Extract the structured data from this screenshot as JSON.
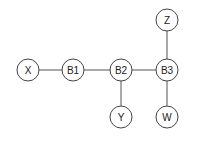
{
  "diagram": {
    "nodes": [
      {
        "id": "X",
        "label": "X",
        "cx": 28,
        "cy": 70
      },
      {
        "id": "B1",
        "label": "B1",
        "cx": 73,
        "cy": 70
      },
      {
        "id": "B2",
        "label": "B2",
        "cx": 121,
        "cy": 70
      },
      {
        "id": "B3",
        "label": "B3",
        "cx": 167,
        "cy": 70
      },
      {
        "id": "Z",
        "label": "Z",
        "cx": 167,
        "cy": 20
      },
      {
        "id": "Y",
        "label": "Y",
        "cx": 121,
        "cy": 117
      },
      {
        "id": "W",
        "label": "W",
        "cx": 167,
        "cy": 117
      }
    ],
    "edges": [
      {
        "from": "X",
        "to": "B1"
      },
      {
        "from": "B1",
        "to": "B2"
      },
      {
        "from": "B2",
        "to": "B3"
      },
      {
        "from": "B3",
        "to": "Z"
      },
      {
        "from": "B2",
        "to": "Y"
      },
      {
        "from": "B3",
        "to": "W"
      }
    ],
    "node_radius": 11
  }
}
